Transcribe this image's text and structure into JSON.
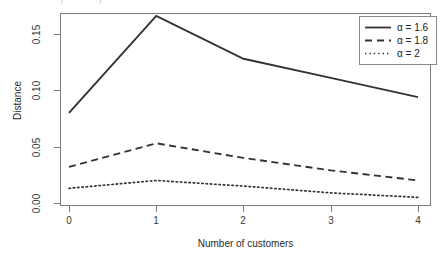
{
  "figure": {
    "caption_remnant": "·  ·    ·   ·   ·      ·  ·· ·· ·)· ·   ·      ·      ·     ·)",
    "width": 441,
    "height": 265,
    "background": "#ffffff"
  },
  "axes": {
    "x_ticks": [
      "0",
      "1",
      "2",
      "3",
      "4"
    ],
    "y_ticks": [
      "0.00",
      "0.05",
      "0.10",
      "0.15"
    ],
    "xlabel": "Number of customers",
    "ylabel": "Distance"
  },
  "legend": {
    "entries": [
      {
        "label": "α = 1.6",
        "style": "solid",
        "name": "legend-item-alpha-1-6"
      },
      {
        "label": "α = 1.8",
        "style": "dashed",
        "name": "legend-item-alpha-1-8"
      },
      {
        "label": "α = 2",
        "style": "dotted",
        "name": "legend-item-alpha-2"
      }
    ]
  },
  "chart_data": {
    "type": "line",
    "title": "",
    "xlabel": "Number of customers",
    "ylabel": "Distance",
    "x": [
      0,
      1,
      2,
      3,
      4
    ],
    "xlim": [
      -0.1,
      4.35
    ],
    "ylim": [
      0.0,
      0.172
    ],
    "xticks": [
      0,
      1,
      2,
      3,
      4
    ],
    "yticks": [
      0.0,
      0.05,
      0.1,
      0.15
    ],
    "grid": false,
    "legend_position": "top-right",
    "line_color": "#333333",
    "series": [
      {
        "name": "α = 1.6",
        "style": "solid",
        "values": [
          0.08,
          0.166,
          0.128,
          0.111,
          0.094
        ]
      },
      {
        "name": "α = 1.8",
        "style": "dashed",
        "values": [
          0.032,
          0.053,
          0.04,
          0.029,
          0.02
        ]
      },
      {
        "name": "α = 2",
        "style": "dotted",
        "values": [
          0.013,
          0.02,
          0.015,
          0.009,
          0.005
        ]
      }
    ]
  }
}
